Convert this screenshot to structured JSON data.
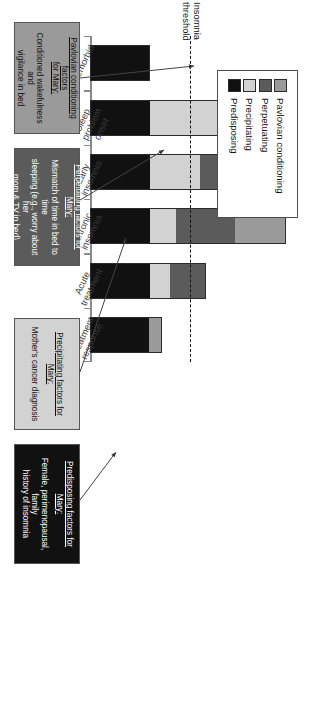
{
  "figure": {
    "threshold_label": "Insomnia\nthreshold"
  },
  "legend": {
    "items": [
      {
        "label": "Pavlovian conditioning",
        "color": "#9a9a9a"
      },
      {
        "label": "Perpetuating",
        "color": "#5b5b5b"
      },
      {
        "label": "Precipitating",
        "color": "#d2d2d2"
      },
      {
        "label": "Predisposing",
        "color": "#111111"
      }
    ]
  },
  "notes": [
    {
      "id": "pavlovian",
      "title": "Pavlovian conditioning factors\nfor Mary:",
      "body": "Conditioned wakefulness and\nvigilance in bed",
      "bg": "#9a9a9a",
      "fg": "#111111"
    },
    {
      "id": "perpetuating",
      "title": "Perpetuating factors for Mary:",
      "body": "Mismatch of time in bed to time\nsleeping (e.g., worry about her\nmom & TV in bed)",
      "bg": "#5b5b5b",
      "fg": "#ffffff"
    },
    {
      "id": "precipitating",
      "title": "Precipitating factors for Mary:",
      "body": "Mother's cancer diagnosis",
      "bg": "#d2d2d2",
      "fg": "#111111"
    },
    {
      "id": "predisposing",
      "title": "Predisposing factors for Mary:",
      "body": "Female, perimenopausal, family\nhistory of insomnia",
      "bg": "#111111",
      "fg": "#ffffff"
    }
  ],
  "chart_data": {
    "type": "bar",
    "title": "",
    "xlabel": "",
    "ylabel": "",
    "orientation": "stacked-vertical",
    "grid": false,
    "legend_position": "top-left",
    "ylim": [
      0,
      100
    ],
    "threshold": {
      "label": "Insomnia threshold",
      "value": 50,
      "style": "dashed"
    },
    "categories": [
      "Premorbid",
      "Sleep\nproblem\nonset",
      "Early\ninsomnia",
      "Chronic\ninsomnia",
      "Acute\ntreatment",
      "Treatment\nresponse"
    ],
    "series": [
      {
        "name": "Predisposing",
        "color": "#111111",
        "values": [
          30,
          30,
          30,
          30,
          30,
          30
        ]
      },
      {
        "name": "Precipitating",
        "color": "#d2d2d2",
        "values": [
          0,
          42,
          25,
          13,
          10,
          0
        ]
      },
      {
        "name": "Perpetuating",
        "color": "#5b5b5b",
        "values": [
          0,
          0,
          32,
          30,
          18,
          0
        ]
      },
      {
        "name": "Pavlovian conditioning",
        "color": "#9a9a9a",
        "values": [
          0,
          0,
          0,
          25,
          0,
          6
        ]
      }
    ],
    "totals": [
      30,
      72,
      87,
      98,
      58,
      36
    ]
  }
}
